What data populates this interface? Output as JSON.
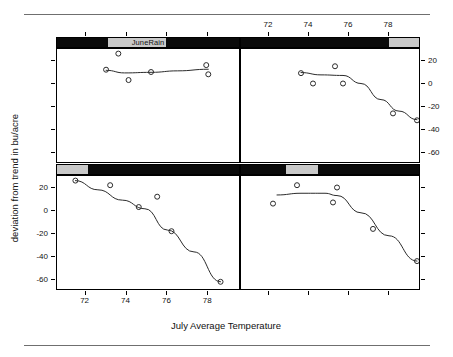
{
  "figure": {
    "kind": "coplot",
    "x_title": "July Average Temperature",
    "y_title": "deviation from trend in bu/acre",
    "conditioning_label": "JuneRain"
  },
  "chart_data": {
    "type": "scatter",
    "title": "",
    "xlabel": "July Average Temperature",
    "ylabel": "deviation from trend in bu/acre",
    "conditioning_variable": "JuneRain",
    "xlim": [
      70.6,
      79.6
    ],
    "ylim": [
      -70,
      30
    ],
    "x_ticks": [
      72,
      74,
      76,
      78,
      80
    ],
    "y_ticks": [
      20,
      0,
      -20,
      -40,
      -60
    ],
    "grid": false,
    "legend": "none",
    "panels": [
      {
        "name": "top-left",
        "row": 1,
        "col": 1,
        "strip_shade_start_pct": 28,
        "strip_shade_end_pct": 46,
        "strip_has_label": true,
        "x": [
          73.0,
          73.6,
          74.1,
          75.2,
          77.9,
          78.0
        ],
        "y": [
          12.0,
          26.0,
          3.0,
          10.0,
          16.0,
          8.0
        ],
        "loess_x": [
          73.0,
          73.9,
          75.2,
          76.5,
          78.0
        ],
        "loess_y": [
          11.5,
          9.2,
          9.7,
          11.0,
          12.4
        ]
      },
      {
        "name": "top-right",
        "row": 1,
        "col": 2,
        "strip_shade_start_pct": 83,
        "strip_shade_end_pct": 100,
        "strip_has_label": false,
        "x": [
          73.6,
          74.2,
          75.3,
          75.7,
          78.2,
          79.4
        ],
        "y": [
          9.0,
          0.0,
          15.0,
          0.0,
          -26.0,
          -32.0
        ],
        "loess_x": [
          73.6,
          74.6,
          75.7,
          76.6,
          77.6,
          78.5,
          79.4
        ],
        "loess_y": [
          9.5,
          7.5,
          7.0,
          0.0,
          -14.0,
          -24.0,
          -31.5
        ]
      },
      {
        "name": "bottom-left",
        "row": 2,
        "col": 1,
        "strip_shade_start_pct": 0,
        "strip_shade_end_pct": 17,
        "strip_has_label": false,
        "x": [
          71.5,
          73.2,
          74.6,
          75.5,
          76.2,
          78.6
        ],
        "y": [
          26.0,
          22.0,
          3.0,
          12.0,
          -18.0,
          -62.0
        ],
        "loess_x": [
          71.5,
          72.6,
          73.8,
          74.9,
          76.0,
          77.3,
          78.6
        ],
        "loess_y": [
          26.0,
          18.0,
          9.0,
          1.5,
          -17.0,
          -36.0,
          -62.0
        ]
      },
      {
        "name": "bottom-right",
        "row": 2,
        "col": 2,
        "strip_shade_start_pct": 25,
        "strip_shade_end_pct": 43,
        "strip_has_label": false,
        "x": [
          72.2,
          73.4,
          75.2,
          75.4,
          77.2,
          79.4
        ],
        "y": [
          6.0,
          22.0,
          7.0,
          20.0,
          -16.0,
          -44.0
        ],
        "loess_x": [
          72.4,
          73.6,
          74.8,
          75.4,
          76.6,
          78.0,
          79.4
        ],
        "loess_y": [
          13.5,
          15.0,
          15.0,
          13.0,
          -2.0,
          -22.0,
          -44.0
        ]
      }
    ]
  },
  "axes": {
    "top": {
      "labels": [
        "72",
        "74",
        "76",
        "78",
        "80"
      ]
    },
    "bottom": {
      "labels": [
        "72",
        "74",
        "76",
        "78",
        "80"
      ]
    },
    "right": {
      "labels": [
        "20",
        "0",
        "-20",
        "-40",
        "-60"
      ]
    },
    "left": {
      "labels": [
        "20",
        "0",
        "-20",
        "-40",
        "-60"
      ]
    }
  }
}
